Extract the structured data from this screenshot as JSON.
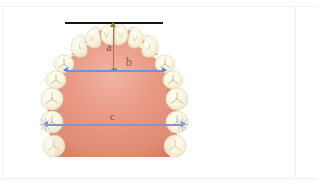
{
  "figure": {
    "background_color": "#ffffff"
  },
  "anatomy": {
    "palate": {
      "name": "palate",
      "fill_color_light": "# efb0a0",
      "fill_color": "#e4917c",
      "fill_color_dark": "#d9826d"
    },
    "teeth": {
      "name": "teeth",
      "enamel_color": "#fbf6e4",
      "outline_color": "#e3dcc0",
      "fissure_color": "#b9ae86",
      "count_per_side": 8
    }
  },
  "measurements": {
    "reference_line": {
      "name": "occlusal-reference-line",
      "color": "#15150f",
      "orientation": "horizontal"
    },
    "items": [
      {
        "id": "a",
        "label": "a",
        "color": "#8a8a3c",
        "orientation": "vertical",
        "description": "arch depth from reference line to intercanine line"
      },
      {
        "id": "b",
        "label": "b",
        "color": "#7b8fd0",
        "orientation": "horizontal",
        "description": "anterior arch width (intercanine width)"
      },
      {
        "id": "c",
        "label": "c",
        "color": "#8295d2",
        "orientation": "horizontal",
        "description": "posterior arch width (intermolar width)"
      }
    ]
  }
}
